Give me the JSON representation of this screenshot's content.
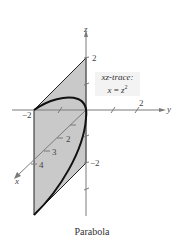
{
  "figure": {
    "caption": "Parabola",
    "top_fragment": "...y, paraboloid surface...",
    "trace_label": {
      "line1": "xz-trace:",
      "line2_lhs": "x",
      "line2_eq": "=",
      "line2_rhs": "z",
      "line2_exp": "2"
    },
    "axes": {
      "z": {
        "label": "z",
        "ticks": [
          {
            "label": "2"
          },
          {
            "label": "−2"
          }
        ]
      },
      "y": {
        "label": "y",
        "ticks": [
          {
            "label": "2"
          },
          {
            "label": "−2"
          }
        ]
      },
      "x": {
        "label": "x",
        "ticks": [
          {
            "label": "2"
          },
          {
            "label": "3"
          },
          {
            "label": "4"
          }
        ]
      }
    },
    "colors": {
      "plane_fill": "#c8c8c8",
      "axis": "#7a7a7a",
      "curve": "#111111",
      "trace_box": "#f3f3f3"
    }
  }
}
